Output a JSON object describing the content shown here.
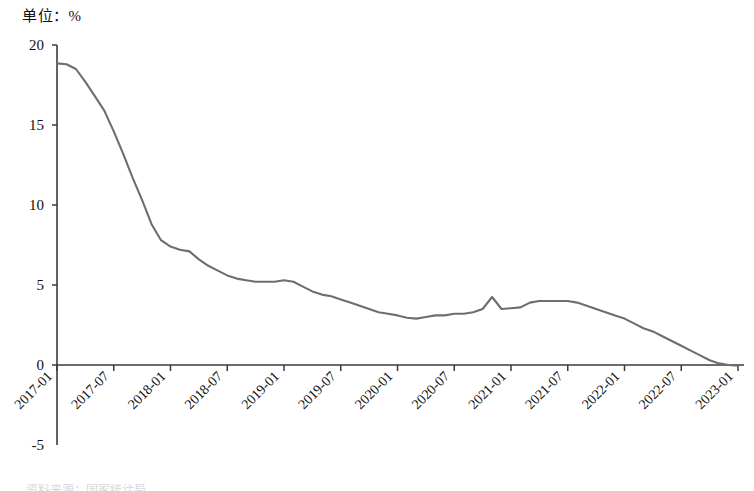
{
  "unit_label": "单位：%",
  "source_note": "资料来源：国家统计局",
  "colors": {
    "line": "#6e6e6e",
    "axis": "#3a3a3a",
    "text": "#111111"
  },
  "chart_data": {
    "type": "line",
    "title": "",
    "subtitle": "",
    "xlabel": "",
    "ylabel": "单位：%",
    "grid": false,
    "legend": "none",
    "ylim": [
      -5,
      20
    ],
    "yticks": [
      20,
      15,
      10,
      5,
      0,
      -5
    ],
    "ytick_labels": [
      "20",
      "15",
      "10",
      "5",
      "0",
      "-5"
    ],
    "xlim": [
      "2017-01",
      "2023-01"
    ],
    "xticks": [
      "2017-01",
      "2017-07",
      "2018-01",
      "2018-07",
      "2019-01",
      "2019-07",
      "2020-01",
      "2020-07",
      "2021-01",
      "2021-07",
      "2022-01",
      "2022-07",
      "2023-01"
    ],
    "xtick_rotation": 45,
    "series": [
      {
        "name": "同比增速",
        "x": [
          "2017-01",
          "2017-02",
          "2017-03",
          "2017-04",
          "2017-05",
          "2017-06",
          "2017-07",
          "2017-08",
          "2017-09",
          "2017-10",
          "2017-11",
          "2017-12",
          "2018-01",
          "2018-02",
          "2018-03",
          "2018-04",
          "2018-05",
          "2018-06",
          "2018-07",
          "2018-08",
          "2018-09",
          "2018-10",
          "2018-11",
          "2018-12",
          "2019-01",
          "2019-02",
          "2019-03",
          "2019-04",
          "2019-05",
          "2019-06",
          "2019-07",
          "2019-08",
          "2019-09",
          "2019-10",
          "2019-11",
          "2019-12",
          "2020-01",
          "2020-02",
          "2020-03",
          "2020-04",
          "2020-05",
          "2020-06",
          "2020-07",
          "2020-08",
          "2020-09",
          "2020-10",
          "2020-11",
          "2020-12",
          "2021-01",
          "2021-02",
          "2021-03",
          "2021-04",
          "2021-05",
          "2021-06",
          "2021-07",
          "2021-08",
          "2021-09",
          "2021-10",
          "2021-11",
          "2021-12",
          "2022-01",
          "2022-02",
          "2022-03",
          "2022-04",
          "2022-05",
          "2022-06",
          "2022-07",
          "2022-08",
          "2022-09",
          "2022-10",
          "2022-11",
          "2022-12",
          "2023-01"
        ],
        "values": [
          18.85,
          18.8,
          18.5,
          17.7,
          16.8,
          15.9,
          14.6,
          13.2,
          11.7,
          10.3,
          8.8,
          7.8,
          7.4,
          7.2,
          7.1,
          6.6,
          6.2,
          5.9,
          5.6,
          5.4,
          5.3,
          5.2,
          5.2,
          5.2,
          5.3,
          5.2,
          4.9,
          4.6,
          4.4,
          4.3,
          4.1,
          3.9,
          3.7,
          3.5,
          3.3,
          3.2,
          3.1,
          2.95,
          2.9,
          3.0,
          3.1,
          3.1,
          3.2,
          3.2,
          3.3,
          3.5,
          4.25,
          3.5,
          3.55,
          3.6,
          3.9,
          4.0,
          4.0,
          4.0,
          4.0,
          3.9,
          3.7,
          3.5,
          3.3,
          3.1,
          2.9,
          2.6,
          2.3,
          2.1,
          1.8,
          1.5,
          1.2,
          0.9,
          0.6,
          0.3,
          0.1,
          0.0,
          -0.05
        ]
      }
    ]
  }
}
